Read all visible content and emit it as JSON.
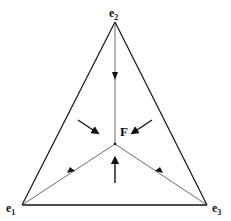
{
  "diagram": {
    "type": "simplex-phase-portrait",
    "vertices": [
      {
        "id": "e1",
        "label": "e",
        "subscript": "1",
        "position": "bottom-left"
      },
      {
        "id": "e2",
        "label": "e",
        "subscript": "2",
        "position": "top"
      },
      {
        "id": "e3",
        "label": "e",
        "subscript": "3",
        "position": "bottom-right"
      }
    ],
    "center_point": {
      "label": "F"
    },
    "edges": [
      "e1-e2",
      "e2-e3",
      "e3-e1"
    ],
    "internal_lines": [
      "e2-F",
      "e1-F",
      "e3-F"
    ],
    "flow_direction": "all arrows point toward F"
  }
}
